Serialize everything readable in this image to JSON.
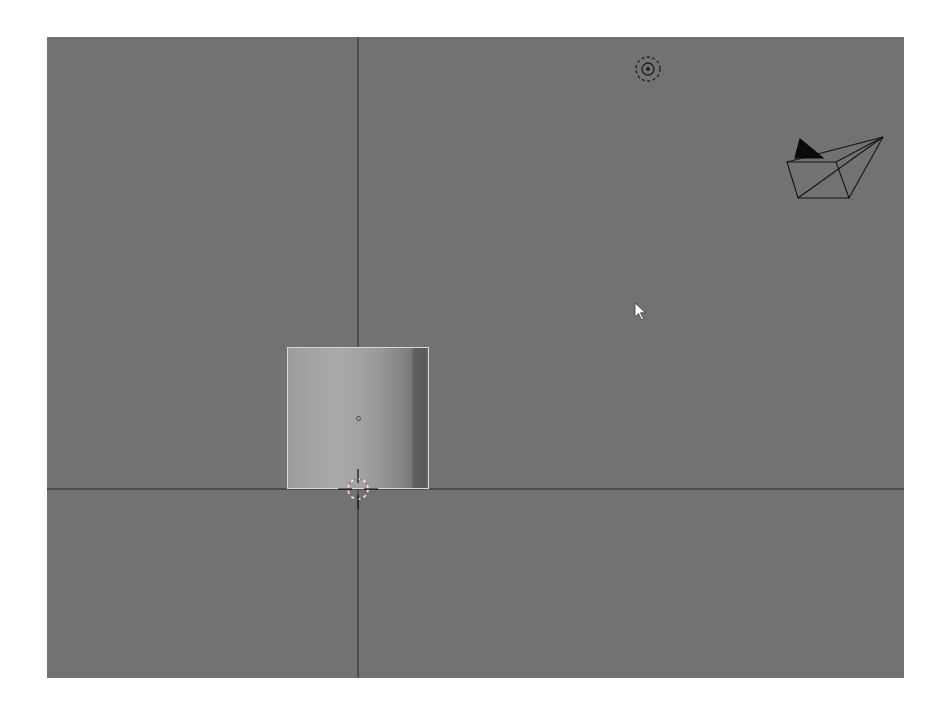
{
  "app": {
    "type": "3d-viewport",
    "view": "orthographic-front"
  },
  "viewport": {
    "background_color": "#727272",
    "axis_line_color": "#2a2a2a",
    "axis_origin": {
      "x": 311,
      "y": 452
    }
  },
  "objects": [
    {
      "name": "cylinder",
      "type": "mesh",
      "selected": true,
      "outline_color": "#d8d8d8"
    },
    {
      "name": "lamp",
      "type": "light"
    },
    {
      "name": "camera",
      "type": "camera"
    }
  ],
  "icons": {
    "lamp": "light-icon",
    "camera": "camera-icon",
    "cursor_3d": "3d-cursor-icon",
    "mouse": "mouse-pointer-icon",
    "origin": "object-origin-icon"
  }
}
